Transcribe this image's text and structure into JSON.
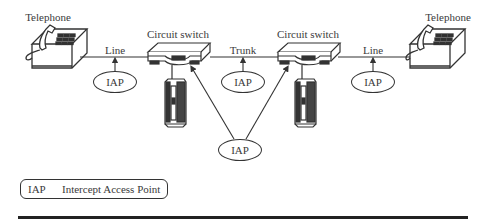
{
  "diagram": {
    "type": "network-topology",
    "nodes": {
      "telephone_left": {
        "label": "Telephone"
      },
      "switch_left": {
        "label": "Circuit switch"
      },
      "switch_right": {
        "label": "Circuit switch"
      },
      "telephone_right": {
        "label": "Telephone"
      }
    },
    "links": [
      {
        "from": "telephone_left",
        "to": "switch_left",
        "label": "Line"
      },
      {
        "from": "switch_left",
        "to": "switch_right",
        "label": "Trunk"
      },
      {
        "from": "switch_right",
        "to": "telephone_right",
        "label": "Line"
      }
    ],
    "iaps": [
      {
        "label": "IAP",
        "attached_to": "line-left"
      },
      {
        "label": "IAP",
        "attached_to": "trunk"
      },
      {
        "label": "IAP",
        "attached_to": "line-right"
      },
      {
        "label": "IAP",
        "attached_to": "both-switches"
      }
    ],
    "legend": {
      "abbr": "IAP",
      "text": "Intercept Access Point"
    }
  },
  "colors": {
    "stroke": "#333333",
    "background": "#ffffff",
    "rule": "#222222"
  }
}
